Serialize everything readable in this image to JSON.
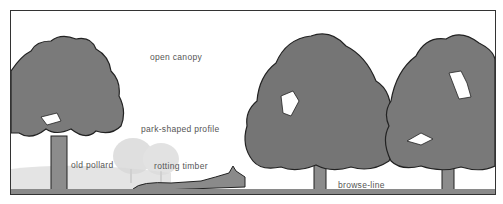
{
  "illustration": {
    "subject": "parkland trees",
    "labels": {
      "open_canopy": "open canopy",
      "park_shaped_profile": "park-shaped profile",
      "old_pollard": "old pollard",
      "rotting_timber": "rotting timber",
      "browse_line": "browse-line"
    },
    "colors": {
      "foliage": "#7f7f7f",
      "foliage_dark": "#6a6a6a",
      "outline": "#222222",
      "distant_trees": "#d8d8d8",
      "ground": "#8a8a8a",
      "background": "#ffffff"
    }
  }
}
